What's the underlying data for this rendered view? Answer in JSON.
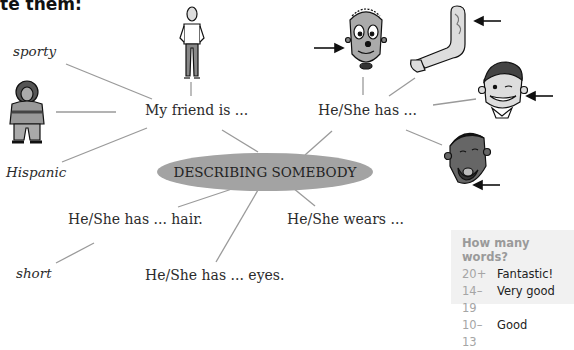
{
  "title": "te them:",
  "center_node": {
    "label": "DESCRIBING SOMEBODY",
    "fill": "#a3a3a3"
  },
  "branches": [
    {
      "label": "My friend is ...",
      "children": [
        "sporty",
        "Hispanic",
        "[tall man illustration]",
        "[short woman illustration]"
      ]
    },
    {
      "label": "He/She has ...",
      "children": [
        "[face with earrings]",
        "[tattooed arm]",
        "[smiling boy with braces]",
        "[man with beard]"
      ]
    },
    {
      "label": "He/She has ... hair.",
      "children": [
        "short"
      ]
    },
    {
      "label": "He/She has ... eyes.",
      "children": []
    },
    {
      "label": "He/She wears ...",
      "children": []
    }
  ],
  "labels": {
    "sporty": "sporty",
    "hispanic": "Hispanic",
    "short": "short",
    "my_friend": "My friend is ...",
    "he_has": "He/She has ...",
    "he_hair": "He/She has ... hair.",
    "he_eyes": "He/She has ... eyes.",
    "he_wears": "He/She wears ..."
  },
  "score_box": {
    "heading": "How many words?",
    "rows": [
      {
        "range": "20+",
        "rating": "Fantastic!"
      },
      {
        "range": "14–19",
        "rating": "Very good"
      },
      {
        "range": "10–13",
        "rating": "Good"
      }
    ]
  }
}
